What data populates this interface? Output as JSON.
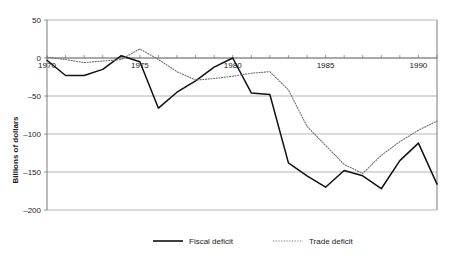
{
  "chart_data": {
    "type": "line",
    "title": "",
    "xlabel": "",
    "ylabel": "Billions of dollars",
    "xlim": [
      1970,
      1991
    ],
    "ylim": [
      -200,
      50
    ],
    "grid": true,
    "legend_position": "bottom",
    "y_ticks": [
      50,
      0,
      -50,
      -100,
      -150,
      -200
    ],
    "y_tick_labels": [
      "50",
      "0",
      "–50",
      "–100",
      "–150",
      "–200"
    ],
    "x_ticks": [
      1970,
      1975,
      1980,
      1985,
      1990
    ],
    "x_tick_labels": [
      "1970",
      "1975",
      "1980",
      "1985",
      "1990"
    ],
    "x_minor_step": 1,
    "x": [
      1970,
      1971,
      1972,
      1973,
      1974,
      1975,
      1976,
      1977,
      1978,
      1979,
      1980,
      1981,
      1982,
      1983,
      1984,
      1985,
      1986,
      1987,
      1988,
      1989,
      1990,
      1991
    ],
    "series": [
      {
        "name": "Fiscal deficit",
        "style": "solid",
        "color": "#111111",
        "values": [
          -3,
          -23,
          -23,
          -15,
          3,
          -5,
          -66,
          -45,
          -30,
          -12,
          0,
          -46,
          -48,
          -138,
          -155,
          -170,
          -148,
          -155,
          -172,
          -135,
          -112,
          -166
        ]
      },
      {
        "name": "Trade deficit",
        "style": "dotted",
        "color": "#6d6d6d",
        "values": [
          1,
          -2,
          -6,
          -4,
          -2,
          12,
          -2,
          -18,
          -29,
          -27,
          -24,
          -20,
          -18,
          -42,
          -90,
          -115,
          -140,
          -152,
          -128,
          -110,
          -95,
          -83
        ]
      }
    ],
    "legend": [
      {
        "label": "Fiscal deficit",
        "style": "solid",
        "color": "#111111"
      },
      {
        "label": "Trade deficit",
        "style": "dotted",
        "color": "#6d6d6d"
      }
    ]
  }
}
